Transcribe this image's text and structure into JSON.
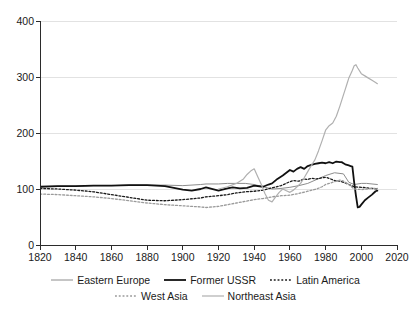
{
  "chart_data": {
    "type": "line",
    "title": "",
    "subtitle": "",
    "xlabel": "",
    "ylabel": "",
    "xlim": [
      1820,
      2020
    ],
    "ylim": [
      0,
      400
    ],
    "xticks": [
      1820,
      1840,
      1860,
      1880,
      1900,
      1920,
      1940,
      1960,
      1980,
      2000,
      2020
    ],
    "yticks": [
      0,
      100,
      200,
      300,
      400
    ],
    "grid": "horizontal",
    "legend_position": "bottom",
    "series": [
      {
        "name": "Eastern Europe",
        "color": "#8c8c8c",
        "style": "solid",
        "width": 1.0,
        "x": [
          1820,
          1830,
          1840,
          1850,
          1860,
          1870,
          1880,
          1890,
          1900,
          1910,
          1913,
          1920,
          1925,
          1930,
          1935,
          1940,
          1945,
          1950,
          1955,
          1960,
          1965,
          1970,
          1975,
          1980,
          1985,
          1990,
          1993,
          1996,
          2000,
          2003,
          2006,
          2009
        ],
        "values": [
          104,
          105,
          105,
          106,
          106,
          107,
          107,
          107,
          106,
          108,
          109,
          109,
          110,
          110,
          110,
          108,
          104,
          100,
          101,
          103,
          106,
          110,
          117,
          124,
          129,
          127,
          112,
          108,
          110,
          110,
          109,
          108
        ]
      },
      {
        "name": "Former USSR",
        "color": "#111111",
        "style": "solid",
        "width": 1.8,
        "x": [
          1820,
          1830,
          1840,
          1850,
          1860,
          1870,
          1880,
          1890,
          1900,
          1905,
          1910,
          1913,
          1920,
          1925,
          1928,
          1932,
          1936,
          1940,
          1945,
          1948,
          1950,
          1953,
          1956,
          1958,
          1960,
          1962,
          1964,
          1966,
          1968,
          1970,
          1972,
          1974,
          1976,
          1978,
          1980,
          1982,
          1984,
          1986,
          1988,
          1989,
          1990,
          1991,
          1992,
          1993,
          1994,
          1995,
          1996,
          1997,
          1998,
          1999,
          2000,
          2002,
          2004,
          2006,
          2008,
          2009
        ],
        "values": [
          104,
          105,
          105,
          106,
          106,
          107,
          107,
          105,
          99,
          97,
          100,
          103,
          97,
          101,
          103,
          101,
          102,
          106,
          104,
          108,
          110,
          118,
          124,
          129,
          134,
          131,
          136,
          139,
          136,
          141,
          143,
          145,
          146,
          147,
          146,
          148,
          146,
          149,
          148,
          148,
          146,
          144,
          143,
          142,
          141,
          140,
          112,
          88,
          67,
          68,
          72,
          80,
          85,
          90,
          96,
          97
        ]
      },
      {
        "name": "Latin America",
        "color": "#1a1a1a",
        "style": "dotted",
        "width": 1.3,
        "x": [
          1820,
          1830,
          1840,
          1850,
          1860,
          1870,
          1880,
          1890,
          1900,
          1910,
          1913,
          1920,
          1925,
          1930,
          1935,
          1940,
          1945,
          1950,
          1955,
          1960,
          1962,
          1965,
          1968,
          1970,
          1972,
          1975,
          1978,
          1980,
          1982,
          1985,
          1988,
          1990,
          1993,
          1996,
          2000,
          2003,
          2006,
          2009
        ],
        "values": [
          101,
          100,
          98,
          95,
          90,
          85,
          80,
          79,
          81,
          84,
          86,
          88,
          90,
          93,
          95,
          96,
          98,
          102,
          106,
          113,
          115,
          114,
          118,
          117,
          119,
          118,
          120,
          121,
          119,
          115,
          114,
          112,
          108,
          104,
          103,
          102,
          101,
          100
        ]
      },
      {
        "name": "West Asia",
        "color": "#9a9a9a",
        "style": "dotted",
        "width": 1.3,
        "x": [
          1820,
          1830,
          1840,
          1850,
          1860,
          1870,
          1880,
          1890,
          1900,
          1910,
          1913,
          1920,
          1925,
          1930,
          1935,
          1940,
          1945,
          1950,
          1955,
          1960,
          1965,
          1970,
          1975,
          1978,
          1980,
          1982,
          1985,
          1988,
          1990,
          1993,
          1996,
          2000,
          2003,
          2006,
          2009
        ],
        "values": [
          91,
          90,
          88,
          86,
          83,
          79,
          75,
          72,
          70,
          68,
          67,
          69,
          72,
          75,
          78,
          81,
          83,
          86,
          88,
          89,
          92,
          96,
          100,
          104,
          108,
          110,
          113,
          116,
          114,
          108,
          100,
          99,
          100,
          101,
          101
        ]
      },
      {
        "name": "Northeast Asia",
        "color": "#b0b0b0",
        "style": "solid",
        "width": 1.2,
        "x": [
          1920,
          1925,
          1930,
          1934,
          1936,
          1938,
          1940,
          1942,
          1944,
          1946,
          1948,
          1950,
          1952,
          1954,
          1956,
          1958,
          1960,
          1962,
          1964,
          1966,
          1968,
          1970,
          1972,
          1974,
          1976,
          1978,
          1980,
          1982,
          1984,
          1986,
          1988,
          1990,
          1991,
          1992,
          1993,
          1994,
          1995,
          1996,
          1997,
          1998,
          2000,
          2002,
          2004,
          2006,
          2008,
          2009
        ],
        "values": [
          100,
          104,
          110,
          118,
          126,
          132,
          136,
          122,
          108,
          92,
          80,
          77,
          86,
          94,
          100,
          97,
          94,
          98,
          104,
          110,
          120,
          131,
          142,
          152,
          168,
          186,
          205,
          213,
          218,
          230,
          248,
          268,
          278,
          288,
          298,
          305,
          312,
          320,
          322,
          316,
          306,
          302,
          298,
          294,
          290,
          288
        ]
      }
    ]
  },
  "axes": {
    "y_tick_labels": [
      "400",
      "300",
      "200",
      "100",
      "0"
    ],
    "x_tick_labels": [
      "1820",
      "1840",
      "1860",
      "1880",
      "1900",
      "1920",
      "1940",
      "1960",
      "1980",
      "2000",
      "2020"
    ]
  },
  "legend": {
    "rows": [
      [
        {
          "label": "Eastern Europe",
          "swatch": "line-solid-gray-thin"
        },
        {
          "label": "Former USSR",
          "swatch": "line-solid-black-thick"
        },
        {
          "label": "Latin America",
          "swatch": "line-dotted-black"
        }
      ],
      [
        {
          "label": "West Asia",
          "swatch": "line-dotted-gray"
        },
        {
          "label": "Northeast Asia",
          "swatch": "line-solid-gray"
        }
      ]
    ]
  },
  "colors": {
    "eastern_europe": "#8c8c8c",
    "former_ussr": "#111111",
    "latin_america": "#1a1a1a",
    "west_asia": "#9a9a9a",
    "northeast_asia": "#b0b0b0",
    "axis": "#2b2b2b",
    "grid": "#e2e2e2",
    "background": "#ffffff"
  }
}
